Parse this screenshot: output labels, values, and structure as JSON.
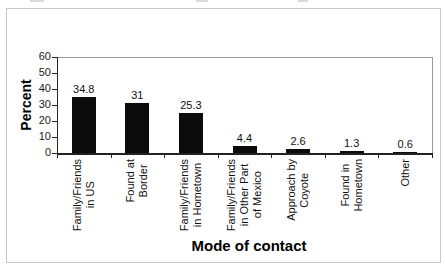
{
  "figure": {
    "ylabel": "Percent",
    "xlabel": "Mode of contact"
  },
  "chart_data": {
    "type": "bar",
    "title": "",
    "xlabel": "Mode of contact",
    "ylabel": "Percent",
    "categories": [
      "Family/Friends in US",
      "Found at Border",
      "Family/Friends in Hometown",
      "Family/Friends in Other Part of Mexico",
      "Approach by Coyote",
      "Found in Hometown",
      "Other"
    ],
    "category_lines": [
      [
        "Family/Friends",
        "in US"
      ],
      [
        "Found at",
        "Border"
      ],
      [
        "Family/Friends",
        "in Hometown"
      ],
      [
        "Family/Friends",
        "in Other Part",
        "of Mexico"
      ],
      [
        "Approach by",
        "Coyote"
      ],
      [
        "Found in",
        "Hometown"
      ],
      [
        "Other"
      ]
    ],
    "values": [
      34.8,
      31,
      25.3,
      4.4,
      2.6,
      1.3,
      0.6
    ],
    "value_labels": [
      "34.8",
      "31",
      "25.3",
      "4.4",
      "2.6",
      "1.3",
      "0.6"
    ],
    "ylim": [
      0,
      60
    ],
    "yticks": [
      0,
      10,
      20,
      30,
      40,
      50,
      60
    ],
    "bar_color": "#0b0b0b",
    "grid": false,
    "legend": "none"
  }
}
